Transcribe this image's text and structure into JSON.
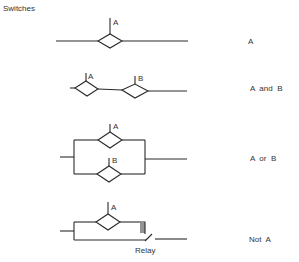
{
  "title": "Switches",
  "colors": {
    "line": "#2a2a2a",
    "text": "#333333",
    "background": "#ffffff"
  },
  "rows": [
    {
      "id": "row-a",
      "logic": "A",
      "switches": [
        "A"
      ]
    },
    {
      "id": "row-a-and-b",
      "logic": "A  and  B",
      "switches": [
        "A",
        "B"
      ]
    },
    {
      "id": "row-a-or-b",
      "logic": "A  or  B",
      "switches": [
        "A",
        "B"
      ]
    },
    {
      "id": "row-not-a",
      "logic": "Not  A",
      "switches": [
        "A"
      ],
      "relay_label": "Relay"
    }
  ]
}
